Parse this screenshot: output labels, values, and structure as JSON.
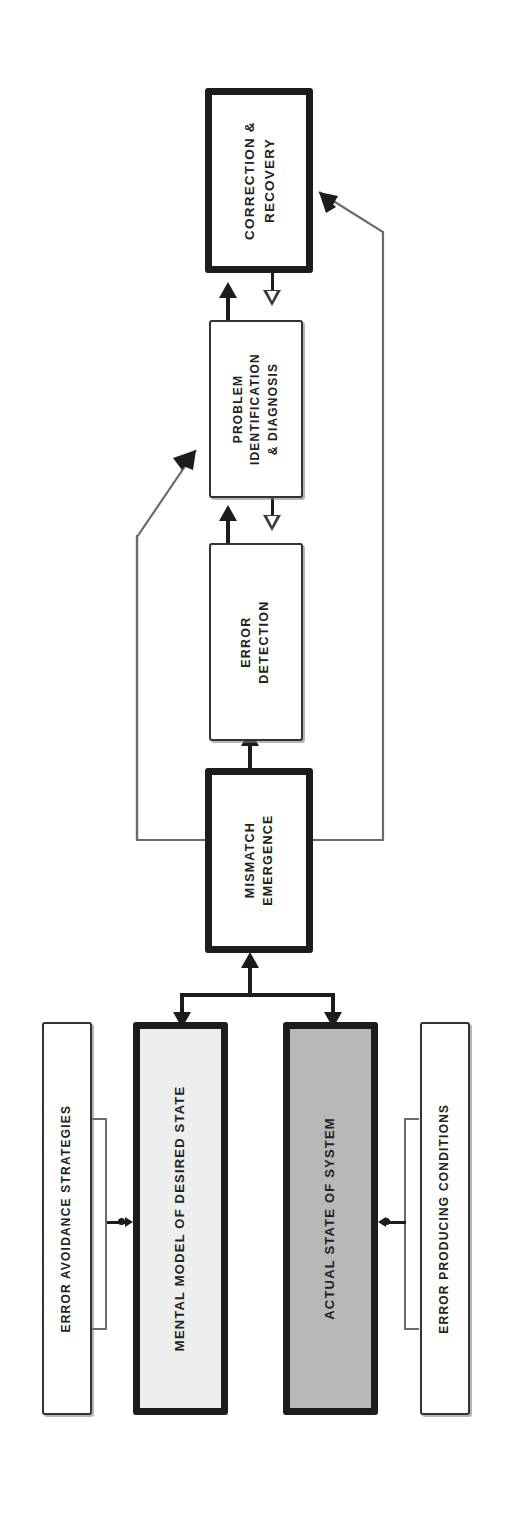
{
  "diagram": {
    "orientation": "rotated-90",
    "colors": {
      "stroke": "#1c1c1c",
      "thin_stroke": "#6a6a6a",
      "box_white": "#ffffff",
      "box_light_gray": "#eeeeee",
      "box_gray": "#b8b8b8",
      "text": "#222222"
    },
    "nodes": [
      {
        "id": "correction-recovery",
        "label": "CORRECTION &\nRECOVERY",
        "line1": "CORRECTION &",
        "line2": "RECOVERY",
        "border": "thick",
        "fill": "#ffffff"
      },
      {
        "id": "problem-identification",
        "label": "PROBLEM\nIDENTIFICATION\n& DIAGNOSIS",
        "line1": "PROBLEM",
        "line2": "IDENTIFICATION",
        "line3": "& DIAGNOSIS",
        "border": "thin",
        "fill": "#ffffff"
      },
      {
        "id": "error-detection",
        "label": "ERROR\nDETECTION",
        "line1": "ERROR",
        "line2": "DETECTION",
        "border": "thin",
        "fill": "#ffffff"
      },
      {
        "id": "mismatch-emergence",
        "label": "MISMATCH\nEMERGENCE",
        "line1": "MISMATCH",
        "line2": "EMERGENCE",
        "border": "thick",
        "fill": "#ffffff"
      },
      {
        "id": "error-avoidance-strategies",
        "label": "ERROR AVOIDANCE STRATEGIES",
        "line1": "ERROR AVOIDANCE STRATEGIES",
        "border": "thin",
        "fill": "#ffffff"
      },
      {
        "id": "mental-model-of-desired-state",
        "label": "MENTAL MODEL OF DESIRED STATE",
        "line1": "MENTAL MODEL OF DESIRED STATE",
        "border": "thick",
        "fill": "#eeeeee"
      },
      {
        "id": "actual-state-of-system",
        "label": "ACTUAL STATE OF SYSTEM",
        "line1": "ACTUAL STATE OF SYSTEM",
        "border": "thick",
        "fill": "#b8b8b8"
      },
      {
        "id": "error-producing-conditions",
        "label": "ERROR PRODUCING CONDITIONS",
        "line1": "ERROR PRODUCING CONDITIONS",
        "border": "thin",
        "fill": "#ffffff"
      }
    ],
    "edges": [
      {
        "id": "mismatch-to-error-detection",
        "from": "mismatch-emergence",
        "to": "error-detection",
        "style": "solid-filled-arrow"
      },
      {
        "id": "error-detection-to-problem-id",
        "from": "error-detection",
        "to": "problem-identification",
        "style": "solid-filled-arrow"
      },
      {
        "id": "problem-id-to-correction",
        "from": "problem-identification",
        "to": "correction-recovery",
        "style": "solid-filled-arrow"
      },
      {
        "id": "correction-to-problem-id-feedback",
        "from": "correction-recovery",
        "to": "problem-identification",
        "style": "hollow-arrow"
      },
      {
        "id": "problem-id-to-error-detection-feedback",
        "from": "problem-identification",
        "to": "error-detection",
        "style": "hollow-arrow"
      },
      {
        "id": "mismatch-to-problem-id-loop",
        "from": "mismatch-emergence",
        "to": "problem-identification",
        "style": "thin-line-arrow"
      },
      {
        "id": "mismatch-to-correction-loop",
        "from": "mismatch-emergence",
        "to": "correction-recovery",
        "style": "thin-line-arrow"
      },
      {
        "id": "split-to-mismatch",
        "from": "state-junction",
        "to": "mismatch-emergence",
        "style": "solid-filled-arrow"
      },
      {
        "id": "junction-to-mental-model",
        "from": "state-junction",
        "to": "mental-model-of-desired-state",
        "style": "solid-filled-arrow"
      },
      {
        "id": "junction-to-actual-state",
        "from": "state-junction",
        "to": "actual-state-of-system",
        "style": "solid-filled-arrow"
      },
      {
        "id": "avoidance-to-mental-model",
        "from": "error-avoidance-strategies",
        "to": "mental-model-of-desired-state",
        "style": "bracket-arrow-right"
      },
      {
        "id": "conditions-to-actual-state",
        "from": "error-producing-conditions",
        "to": "actual-state-of-system",
        "style": "bracket-arrow-left"
      }
    ]
  }
}
